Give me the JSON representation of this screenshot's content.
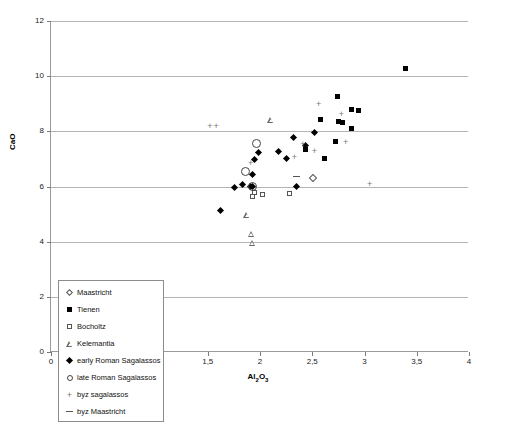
{
  "chart_data": {
    "type": "scatter",
    "title": "",
    "xlabel": "Al2O3",
    "xlabel_parts": {
      "pre": "Al",
      "sub1": "2",
      "mid": "O",
      "sub2": "3"
    },
    "ylabel": "CaO",
    "xlim": [
      0,
      4
    ],
    "ylim": [
      0,
      12
    ],
    "xticks": [
      0,
      0.5,
      1,
      1.5,
      2,
      2.5,
      3,
      3.5,
      4
    ],
    "xtick_labels": [
      "0",
      "0,5",
      "1",
      "1,5",
      "2",
      "2,5",
      "3",
      "3,5",
      "4"
    ],
    "yticks": [
      0,
      2,
      4,
      6,
      8,
      10,
      12
    ],
    "ytick_labels": [
      "0",
      "2",
      "4",
      "6",
      "8",
      "10",
      "12"
    ],
    "grid": "horizontal",
    "legend_position": "bottom-left-inside",
    "series": [
      {
        "name": "Maastricht",
        "marker": "open-diamond",
        "points": [
          [
            2.51,
            6.3
          ]
        ]
      },
      {
        "name": "Tienen",
        "marker": "filled-square",
        "points": [
          [
            3.39,
            10.28
          ],
          [
            2.74,
            9.28
          ],
          [
            2.88,
            8.79
          ],
          [
            2.94,
            8.76
          ],
          [
            2.58,
            8.42
          ],
          [
            2.75,
            8.37
          ],
          [
            2.79,
            8.33
          ],
          [
            2.88,
            8.12
          ],
          [
            2.72,
            7.62
          ],
          [
            2.44,
            7.34
          ],
          [
            2.62,
            7.03
          ]
        ]
      },
      {
        "name": "Bocholtz",
        "marker": "open-square",
        "points": [
          [
            1.95,
            5.78
          ],
          [
            1.93,
            5.62
          ],
          [
            2.02,
            5.71
          ],
          [
            2.28,
            5.73
          ]
        ]
      },
      {
        "name": "Kelemantia",
        "marker": "open-triangle",
        "points": [
          [
            2.11,
            8.41
          ],
          [
            1.88,
            5.18
          ],
          [
            1.92,
            4.72
          ],
          [
            1.93,
            4.6
          ]
        ]
      },
      {
        "name": "early Roman Sagalassos",
        "marker": "filled-diamond",
        "points": [
          [
            2.32,
            7.79
          ],
          [
            2.18,
            7.27
          ],
          [
            2.25,
            7.03
          ],
          [
            2.52,
            7.95
          ],
          [
            2.44,
            7.49
          ],
          [
            1.99,
            7.22
          ],
          [
            1.95,
            6.97
          ],
          [
            1.93,
            6.42
          ],
          [
            1.83,
            6.08
          ],
          [
            1.76,
            5.96
          ],
          [
            1.91,
            6.01
          ],
          [
            1.93,
            5.99
          ],
          [
            2.35,
            5.99
          ],
          [
            1.62,
            5.13
          ]
        ]
      },
      {
        "name": "late Roman Sagalassos",
        "marker": "open-circle",
        "points": [
          [
            1.97,
            7.57
          ],
          [
            1.86,
            6.55
          ],
          [
            1.93,
            5.99
          ]
        ]
      },
      {
        "name": "byz sagalassos",
        "marker": "plus",
        "points": [
          [
            1.52,
            8.21
          ],
          [
            1.58,
            8.19
          ],
          [
            2.56,
            9.0
          ],
          [
            2.78,
            8.63
          ],
          [
            1.91,
            6.87
          ],
          [
            2.41,
            7.55
          ],
          [
            2.52,
            7.3
          ],
          [
            2.82,
            7.6
          ],
          [
            3.05,
            6.08
          ],
          [
            2.33,
            7.08
          ]
        ]
      },
      {
        "name": "byz Maastricht",
        "marker": "dash",
        "points": [
          [
            2.35,
            6.35
          ]
        ]
      }
    ]
  },
  "legend": {
    "items": [
      {
        "label": "Maastricht",
        "marker": "open-diamond"
      },
      {
        "label": "Tienen",
        "marker": "filled-square"
      },
      {
        "label": "Bocholtz",
        "marker": "open-square"
      },
      {
        "label": "Kelemantia",
        "marker": "open-triangle"
      },
      {
        "label": "early Roman Sagalassos",
        "marker": "filled-diamond"
      },
      {
        "label": "late Roman Sagalassos",
        "marker": "open-circle"
      },
      {
        "label": "byz sagalassos",
        "marker": "plus"
      },
      {
        "label": "byz Maastricht",
        "marker": "dash"
      }
    ]
  }
}
